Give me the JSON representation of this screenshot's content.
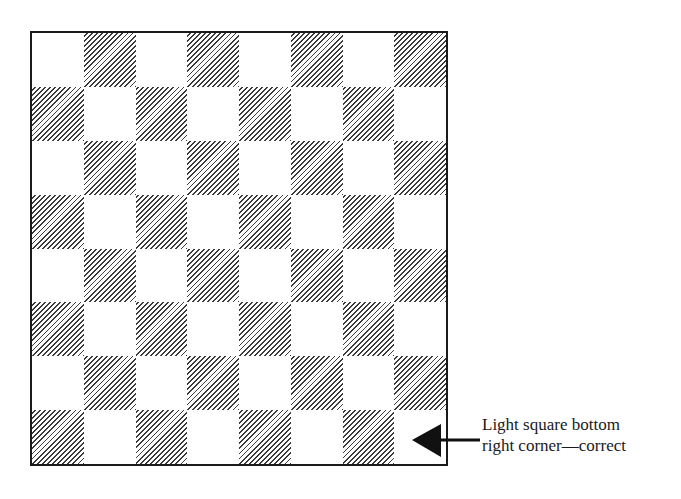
{
  "board": {
    "rows": 8,
    "cols": 8,
    "top_left_color": "light",
    "bottom_right_color": "light",
    "colors": {
      "border": "#1a1a1a",
      "hatch": "#3a3a3a",
      "light": "#ffffff"
    }
  },
  "annotation": {
    "line1": "Light square bottom",
    "line2": "right corner—correct",
    "arrow_direction": "left",
    "points_to": "bottom-right square"
  }
}
